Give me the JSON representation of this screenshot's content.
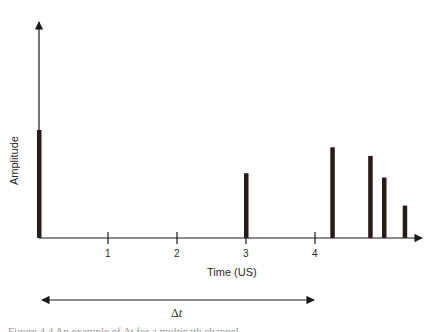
{
  "chart_data": {
    "type": "bar",
    "title": "",
    "xlabel": "Time (US)",
    "ylabel": "Amplitude",
    "x_ticks": [
      1,
      2,
      3,
      4
    ],
    "xlim": [
      0,
      5.5
    ],
    "ylim": [
      0,
      1.0
    ],
    "grid": false,
    "legend": null,
    "series": [
      {
        "name": "pulses",
        "x": [
          0.0,
          3.0,
          4.25,
          4.8,
          5.0,
          5.3
        ],
        "values": [
          0.5,
          0.3,
          0.42,
          0.38,
          0.28,
          0.15
        ]
      }
    ],
    "annotations": [
      {
        "type": "double-arrow",
        "from_x": 0,
        "to_x": 4,
        "label": "Δt"
      }
    ]
  },
  "labels": {
    "ylabel": "Amplitude",
    "xlabel": "Time (US)",
    "ticks": [
      "1",
      "2",
      "3",
      "4"
    ],
    "delta_symbol": "Δ",
    "delta_var": "t",
    "caption": "Figure 4.4 An example of Δt for a multipath channel"
  },
  "colors": {
    "axis": "#1a1a1a",
    "bar": "#2a1a1a",
    "text": "#2a2a2a"
  }
}
